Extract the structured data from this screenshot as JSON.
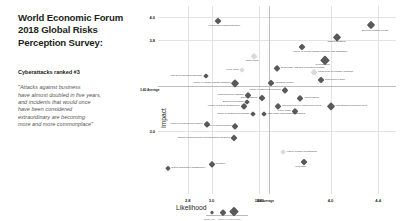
{
  "slide": {
    "title_lines": [
      "World Economic Forum",
      "2018 Global Risks",
      "Perception Survey:"
    ],
    "subhead": "Cyberattacks ranked #3",
    "quote_lines": [
      "\"Attacks against business",
      "have almost doubled in five years,",
      "and incidents that would once",
      "have been considered",
      "extraordinary are becoming",
      "more and more commonplace\""
    ]
  },
  "chart_data": {
    "type": "scatter",
    "title": "",
    "xlabel": "Likelihood",
    "ylabel": "Impact",
    "xlim": [
      2.55,
      4.55
    ],
    "ylim": [
      2.45,
      4.1
    ],
    "xticks": [
      "2.8",
      "3.0",
      "3.4",
      "4.0",
      "4.4"
    ],
    "xtick_values": [
      2.8,
      3.0,
      3.4,
      4.0,
      4.4
    ],
    "yticks": [
      "4.0",
      "3.8",
      "3.0"
    ],
    "ytick_values": [
      4.0,
      3.8,
      3.0
    ],
    "grid": true,
    "legend": "none",
    "averages": {
      "x_label_top": "3.4",
      "x_label_bottom": "3.48 Average",
      "x_value": 3.48,
      "y_label": "3.8",
      "y_sub_label": "3.40 Average",
      "y_value": 3.4
    },
    "size_legend": {
      "caption": "Bubble size = number of respondents",
      "sizes": [
        3,
        4.5,
        6.5
      ]
    },
    "points": [
      {
        "label": "Weapons of mass destruction",
        "x": 3.05,
        "y": 3.97,
        "size": 5.0,
        "tone": "dark",
        "side": "below"
      },
      {
        "label": "Extreme weather events",
        "x": 4.34,
        "y": 3.93,
        "size": 6.0,
        "tone": "dark",
        "side": "below"
      },
      {
        "label": "Natural disasters",
        "x": 4.05,
        "y": 3.83,
        "size": 5.5,
        "tone": "dark",
        "side": "below"
      },
      {
        "label": "Failure of climate change mitigation and adaptation",
        "x": 3.76,
        "y": 3.74,
        "size": 5.0,
        "tone": "dark",
        "side": "below"
      },
      {
        "label": "Water crises",
        "x": 3.36,
        "y": 3.66,
        "size": 4.5,
        "tone": "light",
        "side": "below"
      },
      {
        "label": "Cyberattacks",
        "x": 3.95,
        "y": 3.63,
        "size": 6.5,
        "tone": "dark",
        "side": "below"
      },
      {
        "label": "Biodiversity loss and ecosystem collapse",
        "x": 3.55,
        "y": 3.56,
        "size": 4.5,
        "tone": "dark",
        "side": "above"
      },
      {
        "label": "Food crises",
        "x": 3.26,
        "y": 3.54,
        "size": 4.0,
        "tone": "light",
        "side": "left"
      },
      {
        "label": "Large-scale involuntary migration",
        "x": 3.86,
        "y": 3.52,
        "size": 4.5,
        "tone": "light",
        "side": "right"
      },
      {
        "label": "Spread of infectious diseases",
        "x": 2.95,
        "y": 3.49,
        "size": 4.0,
        "tone": "dark",
        "side": "left"
      },
      {
        "label": "Data fraud or theft",
        "x": 3.92,
        "y": 3.45,
        "size": 5.0,
        "tone": "dark",
        "side": "right"
      },
      {
        "label": "Failure of climate-change mitigation",
        "x": 3.2,
        "y": 3.42,
        "size": 5.5,
        "tone": "dark",
        "side": "left"
      },
      {
        "label": "Interstate conflict",
        "x": 3.5,
        "y": 3.42,
        "size": 5.0,
        "tone": "dark",
        "side": "right"
      },
      {
        "label": "Failure of national governance",
        "x": 3.62,
        "y": 3.36,
        "size": 4.5,
        "tone": "dark",
        "side": "left"
      },
      {
        "label": "Profound social instability",
        "x": 3.31,
        "y": 3.32,
        "size": 4.5,
        "tone": "dark",
        "side": "left"
      },
      {
        "label": "Terrorist attacks",
        "x": 3.42,
        "y": 3.29,
        "size": 5.0,
        "tone": "dark",
        "side": "left"
      },
      {
        "label": "Asset bubbles",
        "x": 3.74,
        "y": 3.29,
        "size": 4.5,
        "tone": "dark",
        "side": "right"
      },
      {
        "label": "Energy price shock",
        "x": 3.3,
        "y": 3.26,
        "size": 4.0,
        "tone": "dark",
        "side": "left"
      },
      {
        "label": "Failure of critical infrastructure",
        "x": 3.27,
        "y": 3.22,
        "size": 4.5,
        "tone": "dark",
        "side": "left"
      },
      {
        "label": "Unemployment or underemployment",
        "x": 3.56,
        "y": 3.22,
        "size": 4.5,
        "tone": "dark",
        "side": "right"
      },
      {
        "label": "High structural unemployment",
        "x": 4.0,
        "y": 3.22,
        "size": 5.5,
        "tone": "dark",
        "side": "right"
      },
      {
        "label": "Fiscal crises",
        "x": 3.7,
        "y": 3.18,
        "size": 4.5,
        "tone": "dark",
        "side": "left"
      },
      {
        "label": "Failure of financial mechanism",
        "x": 3.35,
        "y": 3.15,
        "size": 4.0,
        "tone": "dark",
        "side": "left"
      },
      {
        "label": "Man-made environmental disasters",
        "x": 3.44,
        "y": 3.15,
        "size": 4.0,
        "tone": "dark",
        "side": "right"
      },
      {
        "label": "Failure of regional governance",
        "x": 2.96,
        "y": 3.06,
        "size": 4.5,
        "tone": "dark",
        "side": "left"
      },
      {
        "label": "Failure of urban planning",
        "x": 3.2,
        "y": 3.05,
        "size": 4.5,
        "tone": "dark",
        "side": "left"
      },
      {
        "label": "Adverse consequences of technological advances",
        "x": 3.19,
        "y": 2.94,
        "size": 5.0,
        "tone": "dark",
        "side": "left"
      },
      {
        "label": "Failure of state mechanisms",
        "x": 3.6,
        "y": 2.82,
        "size": 4.0,
        "tone": "light",
        "side": "right"
      },
      {
        "label": "Illicit trade",
        "x": 3.78,
        "y": 2.73,
        "size": 5.0,
        "tone": "dark",
        "side": "below"
      },
      {
        "label": "Deflation",
        "x": 3.0,
        "y": 2.71,
        "size": 4.5,
        "tone": "dark",
        "side": "right"
      },
      {
        "label": "Critical information infrastructure",
        "x": 2.63,
        "y": 2.68,
        "size": 3.5,
        "tone": "dark",
        "side": "right"
      }
    ]
  }
}
